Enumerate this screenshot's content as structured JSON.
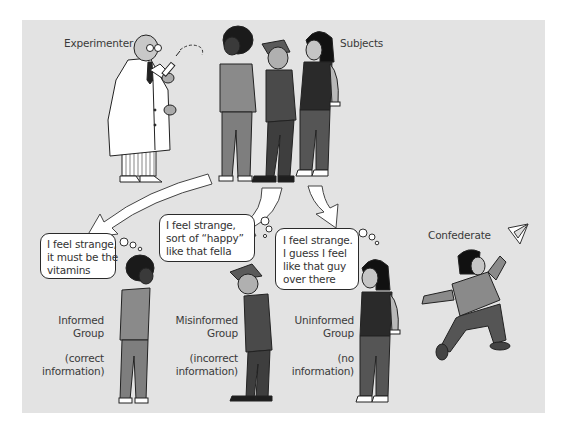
{
  "labels": {
    "experimenter": "Experimenter",
    "subjects": "Subjects",
    "confederate": "Confederate"
  },
  "bubbles": [
    {
      "id": "informed",
      "lines": [
        "I feel strange,",
        "it must be the",
        "vitamins"
      ]
    },
    {
      "id": "misinformed",
      "lines": [
        "I feel strange,",
        "sort of “happy”",
        "like that fella"
      ]
    },
    {
      "id": "uninformed",
      "lines": [
        "I feel strange.",
        "I guess I feel",
        "like that guy",
        "over there"
      ]
    }
  ],
  "groups": [
    {
      "id": "informed",
      "name_line1": "Informed",
      "name_line2": "Group",
      "info_line1": "(correct",
      "info_line2": "information)"
    },
    {
      "id": "misinformed",
      "name_line1": "Misinformed",
      "name_line2": "Group",
      "info_line1": "(incorrect",
      "info_line2": "information)"
    },
    {
      "id": "uninformed",
      "name_line1": "Uninformed",
      "name_line2": "Group",
      "info_line1": "(no",
      "info_line2": "information)"
    }
  ],
  "icons": {
    "syringe": "syringe-icon",
    "paper_airplane": "paper-airplane-icon",
    "arrow": "curved-arrow-icon",
    "thought_dots": "thought-bubble-dots-icon"
  },
  "colors": {
    "panel_bg": "#e3e3e3",
    "page_bg": "#ffffff",
    "bubble_bg": "#ffffff",
    "bubble_border": "#2a2a2a",
    "text": "#3a3a3a",
    "dark_clothing": "#3c3c3c",
    "mid_clothing": "#777777",
    "light_clothing": "#9a9a9a"
  }
}
